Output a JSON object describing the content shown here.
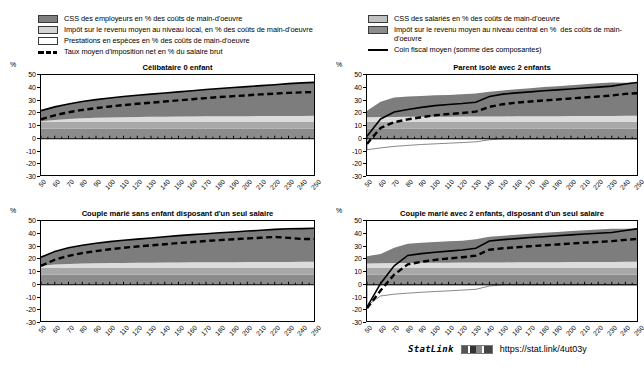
{
  "legend": {
    "left": [
      {
        "type": "swatch",
        "color": "#7f7f7f",
        "label": "CSS des employeurs en % des coûts de main-d'oeuvre"
      },
      {
        "type": "swatch",
        "color": "#d4d4d4",
        "label": "Impôt sur le revenu moyen au niveau local, en % des coûts de main-d'oeuvre"
      },
      {
        "type": "swatch",
        "color": "#ffffff",
        "label": "Prestations en espèces en % des coûts de main-d'oeuvre"
      },
      {
        "type": "dashed",
        "color": "#000000",
        "label": "Taux moyen d'imposition net en % du salaire brut"
      }
    ],
    "right": [
      {
        "type": "swatch",
        "color": "#c0c0c0",
        "label": "CSS des salariés en % des coûts de main-d'oeuvre"
      },
      {
        "type": "swatch",
        "color": "#8c8c8c",
        "label": "Impôt sur le revenu moyen au niveau central en %  des coûts de main-d'oeuvre"
      },
      {
        "type": "solid",
        "color": "#000000",
        "label": "Coin fiscal moyen (somme des composantes)"
      }
    ]
  },
  "axis": {
    "unit": "%",
    "yticks": [
      50,
      40,
      30,
      20,
      10,
      0,
      -10,
      -20,
      -30
    ],
    "ylim": [
      -30,
      50
    ],
    "xticks": [
      50,
      60,
      70,
      80,
      90,
      100,
      110,
      120,
      130,
      140,
      150,
      160,
      170,
      180,
      190,
      200,
      210,
      220,
      230,
      240,
      250
    ],
    "xlim": [
      50,
      250
    ]
  },
  "statlink": {
    "word": "StatLink",
    "badge": "statlink-barcode-icon",
    "url": "https://stat.link/4ut03y"
  },
  "chart_data": [
    {
      "type": "area",
      "title": "Célibataire 0 enfant",
      "xlabel": "",
      "ylabel": "%",
      "xlim": [
        50,
        250
      ],
      "ylim": [
        -30,
        50
      ],
      "grid": false,
      "legend_position": "top",
      "x": [
        50,
        60,
        70,
        80,
        90,
        100,
        110,
        120,
        130,
        140,
        150,
        160,
        170,
        180,
        190,
        200,
        210,
        220,
        230,
        240,
        250
      ],
      "series": [
        {
          "name": "CSS des employeurs en % des coûts de main-d'oeuvre",
          "stack": "positive",
          "color": "#8c8c8c",
          "values": [
            7.8,
            7.8,
            7.8,
            7.8,
            7.8,
            7.8,
            7.8,
            7.8,
            7.8,
            7.8,
            7.8,
            7.8,
            7.8,
            7.8,
            7.8,
            7.8,
            7.8,
            7.8,
            7.8,
            7.8,
            7.8
          ]
        },
        {
          "name": "CSS des salariés en % des coûts de main-d'oeuvre",
          "stack": "positive",
          "color": "#a8a8a8",
          "values": [
            5.4,
            5.4,
            5.4,
            5.4,
            5.4,
            5.4,
            5.4,
            5.4,
            5.4,
            5.4,
            5.4,
            5.4,
            5.4,
            5.4,
            5.4,
            5.4,
            5.4,
            5.4,
            5.4,
            5.4,
            5.4
          ]
        },
        {
          "name": "Impôt sur le revenu moyen au niveau local, en % des coûts de main-d'oeuvre",
          "stack": "positive",
          "color": "#dcdcdc",
          "values": [
            0.6,
            1.5,
            2.2,
            2.8,
            3.2,
            3.5,
            3.7,
            3.9,
            4.0,
            4.1,
            4.2,
            4.3,
            4.4,
            4.4,
            4.5,
            4.5,
            4.6,
            4.6,
            4.7,
            4.7,
            4.8
          ]
        },
        {
          "name": "Impôt sur le revenu moyen au niveau central en %  des coûts de main-d'oeuvre",
          "stack": "positive",
          "color": "#7d7d7d",
          "values": [
            8.2,
            10.3,
            11.9,
            13.2,
            14.3,
            15.3,
            16.2,
            17.0,
            17.8,
            18.6,
            19.4,
            20.2,
            21.0,
            21.8,
            22.5,
            23.2,
            23.9,
            24.6,
            25.3,
            25.9,
            26.3
          ]
        },
        {
          "name": "Prestations en espèces en % des coûts de main-d'oeuvre",
          "stack": "negative",
          "color": "#ffffff",
          "values": [
            0,
            0,
            0,
            0,
            0,
            0,
            0,
            0,
            0,
            0,
            0,
            0,
            0,
            0,
            0,
            0,
            0,
            0,
            0,
            0,
            0
          ]
        }
      ],
      "lines": [
        {
          "name": "Coin fiscal moyen (somme des composantes)",
          "style": "solid",
          "color": "#000000",
          "values": [
            22.0,
            25.0,
            27.3,
            29.2,
            30.7,
            32.0,
            33.1,
            34.1,
            35.0,
            35.9,
            36.8,
            37.7,
            38.6,
            39.4,
            40.2,
            40.9,
            41.7,
            42.4,
            43.2,
            43.8,
            44.3
          ]
        },
        {
          "name": "Taux moyen d'imposition net en % du salaire brut",
          "style": "dashed",
          "color": "#000000",
          "values": [
            15.2,
            18.4,
            20.8,
            22.6,
            24.0,
            25.3,
            26.4,
            27.4,
            28.3,
            29.2,
            30.1,
            31.0,
            31.9,
            32.7,
            33.4,
            34.1,
            34.8,
            35.4,
            36.0,
            36.4,
            36.7
          ]
        }
      ]
    },
    {
      "type": "area",
      "title": "Parent isolé avec 2 enfants",
      "xlabel": "",
      "ylabel": "%",
      "xlim": [
        50,
        250
      ],
      "ylim": [
        -30,
        50
      ],
      "grid": false,
      "legend_position": "top",
      "x": [
        50,
        60,
        70,
        80,
        90,
        100,
        110,
        120,
        130,
        140,
        150,
        160,
        170,
        180,
        190,
        200,
        210,
        220,
        230,
        240,
        250
      ],
      "series": [
        {
          "name": "CSS des employeurs en % des coûts de main-d'oeuvre",
          "stack": "positive",
          "color": "#8c8c8c",
          "values": [
            7.8,
            7.8,
            7.8,
            7.8,
            7.8,
            7.8,
            7.8,
            7.8,
            7.8,
            7.8,
            7.8,
            7.8,
            7.8,
            7.8,
            7.8,
            7.8,
            7.8,
            7.8,
            7.8,
            7.8,
            7.8
          ]
        },
        {
          "name": "CSS des salariés en % des coûts de main-d'oeuvre",
          "stack": "positive",
          "color": "#a8a8a8",
          "values": [
            5.4,
            5.4,
            5.4,
            5.4,
            5.4,
            5.4,
            5.4,
            5.4,
            5.4,
            5.4,
            5.4,
            5.4,
            5.4,
            5.4,
            5.4,
            5.4,
            5.4,
            5.4,
            5.4,
            5.4,
            5.4
          ]
        },
        {
          "name": "Impôt sur le revenu moyen au niveau local, en % des coûts de main-d'oeuvre",
          "stack": "positive",
          "color": "#dcdcdc",
          "values": [
            3.6,
            3.8,
            3.9,
            4.0,
            4.0,
            4.1,
            4.1,
            4.2,
            4.2,
            4.3,
            4.3,
            4.4,
            4.4,
            4.5,
            4.5,
            4.6,
            4.6,
            4.7,
            4.7,
            4.8,
            4.8
          ]
        },
        {
          "name": "Impôt sur le revenu moyen au niveau central en %  des coûts de main-d'oeuvre",
          "stack": "positive",
          "color": "#7d7d7d",
          "values": [
            5.2,
            12.0,
            15.2,
            16.0,
            16.4,
            16.8,
            17.1,
            17.5,
            18.0,
            19.4,
            20.4,
            21.2,
            22.0,
            22.8,
            23.5,
            24.2,
            24.9,
            25.6,
            26.3,
            26.0,
            26.3
          ]
        },
        {
          "name": "Prestations en espèces en % des coûts de main-d'oeuvre",
          "stack": "negative",
          "color": "#ffffff",
          "values": [
            -8.6,
            -7.2,
            -6.0,
            -5.2,
            -4.5,
            -4.0,
            -3.5,
            -3.0,
            -2.4,
            -0.8,
            0,
            0,
            0,
            0,
            0,
            0,
            0,
            0,
            0,
            0,
            0
          ]
        }
      ],
      "lines": [
        {
          "name": "Coin fiscal moyen (somme des composantes)",
          "style": "solid",
          "color": "#000000",
          "values": [
            2.0,
            15.5,
            21.0,
            23.0,
            24.6,
            26.0,
            26.9,
            27.6,
            28.6,
            33.2,
            35.0,
            36.0,
            36.8,
            37.6,
            38.3,
            39.0,
            39.8,
            40.5,
            41.3,
            43.0,
            44.3
          ]
        },
        {
          "name": "Taux moyen d'imposition net en % du salaire brut",
          "style": "dashed",
          "color": "#000000",
          "values": [
            -4.0,
            8.5,
            13.0,
            15.2,
            16.9,
            18.4,
            19.4,
            20.2,
            21.3,
            25.0,
            27.1,
            28.3,
            29.2,
            30.0,
            30.8,
            31.6,
            32.4,
            33.1,
            33.9,
            35.2,
            35.8
          ]
        }
      ]
    },
    {
      "type": "area",
      "title": "Couple marié sans enfant disposant d'un seul salaire",
      "xlabel": "",
      "ylabel": "%",
      "xlim": [
        50,
        250
      ],
      "ylim": [
        -30,
        50
      ],
      "grid": false,
      "legend_position": "top",
      "x": [
        50,
        60,
        70,
        80,
        90,
        100,
        110,
        120,
        130,
        140,
        150,
        160,
        170,
        180,
        190,
        200,
        210,
        220,
        230,
        240,
        250
      ],
      "series": [
        {
          "name": "CSS des employeurs en % des coûts de main-d'oeuvre",
          "stack": "positive",
          "color": "#8c8c8c",
          "values": [
            7.8,
            7.8,
            7.8,
            7.8,
            7.8,
            7.8,
            7.8,
            7.8,
            7.8,
            7.8,
            7.8,
            7.8,
            7.8,
            7.8,
            7.8,
            7.8,
            7.8,
            7.8,
            7.8,
            7.8,
            7.8
          ]
        },
        {
          "name": "CSS des salariés en % des coûts de main-d'oeuvre",
          "stack": "positive",
          "color": "#a8a8a8",
          "values": [
            5.4,
            5.4,
            5.4,
            5.4,
            5.4,
            5.4,
            5.4,
            5.4,
            5.4,
            5.4,
            5.4,
            5.4,
            5.4,
            5.4,
            5.4,
            5.4,
            5.4,
            5.4,
            5.4,
            5.4,
            5.4
          ]
        },
        {
          "name": "Impôt sur le revenu moyen au niveau local, en % des coûts de main-d'oeuvre",
          "stack": "positive",
          "color": "#dcdcdc",
          "values": [
            1.8,
            2.6,
            3.1,
            3.4,
            3.6,
            3.8,
            3.9,
            4.0,
            4.1,
            4.2,
            4.3,
            4.4,
            4.4,
            4.5,
            4.5,
            4.6,
            4.6,
            4.7,
            4.7,
            4.8,
            4.8
          ]
        },
        {
          "name": "Impôt sur le revenu moyen au niveau central en %  des coûts de main-d'oeuvre",
          "stack": "positive",
          "color": "#7d7d7d",
          "values": [
            6.6,
            10.3,
            12.7,
            14.4,
            15.7,
            16.8,
            17.8,
            18.6,
            19.4,
            20.2,
            21.0,
            21.7,
            22.4,
            23.1,
            23.7,
            24.3,
            24.9,
            25.5,
            26.0,
            26.0,
            26.3
          ]
        },
        {
          "name": "Prestations en espèces en % des coûts de main-d'oeuvre",
          "stack": "negative",
          "color": "#ffffff",
          "values": [
            0,
            0,
            0,
            0,
            0,
            0,
            0,
            0,
            0,
            0,
            0,
            0,
            0,
            0,
            0,
            0,
            0,
            0,
            0,
            0,
            0
          ]
        }
      ],
      "lines": [
        {
          "name": "Coin fiscal moyen (somme des composantes)",
          "style": "solid",
          "color": "#000000",
          "values": [
            21.6,
            26.1,
            29.0,
            31.0,
            32.5,
            33.8,
            34.9,
            35.8,
            36.7,
            37.6,
            38.5,
            39.3,
            40.0,
            40.8,
            41.4,
            42.1,
            42.7,
            43.4,
            43.9,
            44.0,
            44.3
          ]
        },
        {
          "name": "Taux moyen d'imposition net en % du salaire brut",
          "style": "dashed",
          "color": "#000000",
          "values": [
            14.8,
            19.6,
            22.7,
            24.8,
            26.4,
            27.8,
            29.0,
            30.0,
            30.9,
            31.8,
            32.7,
            33.5,
            34.3,
            35.0,
            35.7,
            36.3,
            36.9,
            37.5,
            36.8,
            35.9,
            35.8
          ]
        }
      ]
    },
    {
      "type": "area",
      "title": "Couple marié avec 2 enfants, disposant d'un seul salaire",
      "xlabel": "",
      "ylabel": "%",
      "xlim": [
        50,
        250
      ],
      "ylim": [
        -30,
        50
      ],
      "grid": false,
      "legend_position": "top",
      "x": [
        50,
        60,
        70,
        80,
        90,
        100,
        110,
        120,
        130,
        140,
        150,
        160,
        170,
        180,
        190,
        200,
        210,
        220,
        230,
        240,
        250
      ],
      "series": [
        {
          "name": "CSS des employeurs en % des coûts de main-d'oeuvre",
          "stack": "positive",
          "color": "#8c8c8c",
          "values": [
            7.8,
            7.8,
            7.8,
            7.8,
            7.8,
            7.8,
            7.8,
            7.8,
            7.8,
            7.8,
            7.8,
            7.8,
            7.8,
            7.8,
            7.8,
            7.8,
            7.8,
            7.8,
            7.8,
            7.8,
            7.8
          ]
        },
        {
          "name": "CSS des salariés en % des coûts de main-d'oeuvre",
          "stack": "positive",
          "color": "#a8a8a8",
          "values": [
            5.4,
            5.4,
            5.4,
            5.4,
            5.4,
            5.4,
            5.4,
            5.4,
            5.4,
            5.4,
            5.4,
            5.4,
            5.4,
            5.4,
            5.4,
            5.4,
            5.4,
            5.4,
            5.4,
            5.4,
            5.4
          ]
        },
        {
          "name": "Impôt sur le revenu moyen au niveau local, en % des coûts de main-d'oeuvre",
          "stack": "positive",
          "color": "#dcdcdc",
          "values": [
            3.4,
            3.6,
            3.8,
            3.9,
            4.0,
            4.0,
            4.1,
            4.2,
            4.2,
            4.3,
            4.3,
            4.4,
            4.4,
            4.5,
            4.5,
            4.6,
            4.6,
            4.7,
            4.7,
            4.8,
            4.8
          ]
        },
        {
          "name": "Impôt sur le revenu moyen au niveau central en %  des coûts de main-d'oeuvre",
          "stack": "positive",
          "color": "#7d7d7d",
          "values": [
            5.8,
            7.4,
            12.0,
            15.0,
            15.8,
            16.3,
            16.8,
            17.2,
            18.2,
            20.2,
            21.0,
            21.7,
            22.4,
            23.1,
            23.7,
            24.3,
            24.9,
            25.5,
            26.0,
            26.0,
            26.3
          ]
        },
        {
          "name": "Prestations en espèces en % des coûts de main-d'oeuvre",
          "stack": "negative",
          "color": "#ffffff",
          "values": [
            -16.5,
            -8.8,
            -7.4,
            -6.6,
            -5.9,
            -5.3,
            -4.8,
            -4.2,
            -3.6,
            -1.0,
            0,
            0,
            0,
            0,
            0,
            0,
            0,
            0,
            0,
            0,
            0
          ]
        }
      ],
      "lines": [
        {
          "name": "Coin fiscal moyen (somme des composantes)",
          "style": "solid",
          "color": "#000000",
          "values": [
            -17.5,
            1.0,
            14.8,
            23.0,
            24.4,
            25.5,
            26.4,
            27.2,
            28.6,
            34.3,
            35.4,
            36.2,
            37.0,
            37.7,
            38.4,
            39.1,
            39.8,
            40.4,
            41.0,
            42.5,
            44.0
          ]
        },
        {
          "name": "Taux moyen d'imposition net en % du salaire brut",
          "style": "dashed",
          "color": "#000000",
          "values": [
            -18.5,
            -4.5,
            8.0,
            16.0,
            18.0,
            19.5,
            20.6,
            21.6,
            22.8,
            27.5,
            28.6,
            29.4,
            30.2,
            30.9,
            31.6,
            32.3,
            33.0,
            33.6,
            34.2,
            35.2,
            36.0
          ]
        }
      ]
    }
  ]
}
